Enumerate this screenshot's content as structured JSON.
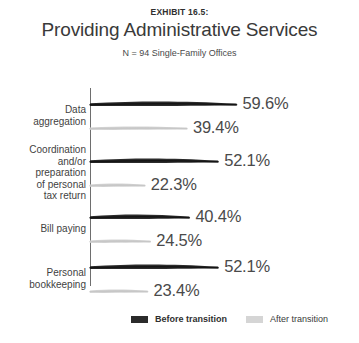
{
  "header": {
    "exhibit_label": "EXHIBIT 16.5:",
    "title": "Providing Administrative Services",
    "subtitle": "N = 94 Single-Family Offices"
  },
  "legend": {
    "before": {
      "label": "Before transition",
      "color": "#2b2b2b",
      "swatch_icon": "bar-swatch-dark"
    },
    "after": {
      "label": "After transition",
      "color": "#d5d5d5",
      "swatch_icon": "bar-swatch-light"
    }
  },
  "chart_data": {
    "type": "bar",
    "orientation": "horizontal",
    "title": "Providing Administrative Services",
    "subtitle": "N = 94 Single-Family Offices",
    "xlabel": "",
    "ylabel": "",
    "xlim": [
      0,
      70
    ],
    "grid": false,
    "legend_position": "bottom",
    "categories": [
      "Data aggregation",
      "Coordination and/or preparation of personal tax return",
      "Bill paying",
      "Personal bookkeeping"
    ],
    "category_lines": [
      [
        "Data",
        "aggregation"
      ],
      [
        "Coordination",
        "and/or",
        "preparation",
        "of personal",
        "tax return"
      ],
      [
        "Bill paying"
      ],
      [
        "Personal",
        "bookkeeping"
      ]
    ],
    "series": [
      {
        "name": "Before transition",
        "color": "#2b2b2b",
        "values": [
          59.6,
          52.1,
          40.4,
          52.1
        ],
        "labels": [
          "59.6%",
          "52.1%",
          "40.4%",
          "52.1%"
        ]
      },
      {
        "name": "After transition",
        "color": "#d5d5d5",
        "values": [
          39.4,
          22.3,
          24.5,
          23.4
        ],
        "labels": [
          "39.4%",
          "22.3%",
          "24.5%",
          "23.4%"
        ]
      }
    ]
  }
}
